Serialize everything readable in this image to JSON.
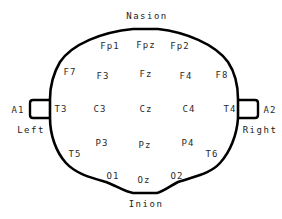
{
  "diagram": {
    "landmarks": {
      "top": "Nasion",
      "bottom": "Inion",
      "left": "Left",
      "right": "Right"
    },
    "ears": {
      "left": "A1",
      "right": "A2"
    },
    "electrodes": {
      "fp1": "Fp1",
      "fpz": "Fpz",
      "fp2": "Fp2",
      "f7": "F7",
      "f3": "F3",
      "fz": "Fz",
      "f4": "F4",
      "f8": "F8",
      "t3": "T3",
      "c3": "C3",
      "cz": "Cz",
      "c4": "C4",
      "t4": "T4",
      "t5": "T5",
      "p3": "P3",
      "pz": "Pz",
      "p4": "P4",
      "t6": "T6",
      "o1": "O1",
      "oz": "Oz",
      "o2": "O2"
    },
    "colors": {
      "outline": "#000000",
      "text": "#2a2a2a",
      "background": "#ffffff"
    }
  }
}
